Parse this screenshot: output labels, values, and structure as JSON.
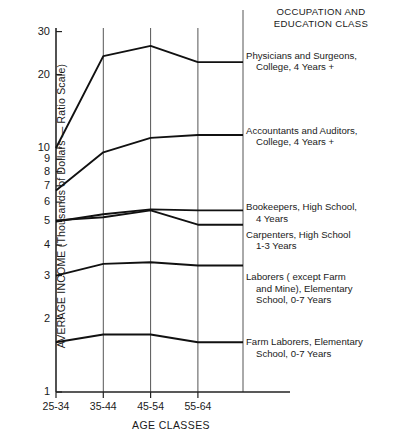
{
  "chart_data": {
    "type": "line",
    "title": "OCCUPATION AND EDUCATION CLASS",
    "xlabel": "AGE CLASSES",
    "ylabel": "AVERAGE INCOME (Thousands of Dollars — Ratio Scale)",
    "yscale": "log",
    "ylim": [
      1,
      30
    ],
    "ytick_labels": [
      "30",
      "20",
      "10",
      "9",
      "8",
      "7",
      "6",
      "5",
      "4",
      "3",
      "2",
      "1"
    ],
    "ytick_values": [
      30,
      20,
      10,
      9,
      8,
      7,
      6,
      5,
      4,
      3,
      2,
      1
    ],
    "categories": [
      "25-34",
      "35-44",
      "45-54",
      "55-64"
    ],
    "grid": "vertical-only",
    "legend_position": "right-inline-labels",
    "series": [
      {
        "name": "Physicians and Surgeons, College, 4 Years +",
        "label_line1": "Physicians and Surgeons,",
        "label_line2": "College, 4 Years +",
        "values": [
          10.0,
          23.8,
          26.2,
          22.5
        ]
      },
      {
        "name": "Accountants and Auditors, College, 4 Years +",
        "label_line1": "Accountants and Auditors,",
        "label_line2": "College, 4 Years +",
        "values": [
          6.7,
          9.6,
          11.0,
          11.3
        ]
      },
      {
        "name": "Bookeepers, High School, 4 Years",
        "label_line1": "Bookeepers, High School,",
        "label_line2": "4 Years",
        "values": [
          5.0,
          5.35,
          5.6,
          5.55
        ]
      },
      {
        "name": "Carpenters, High School 1-3 Years",
        "label_line1": "Carpenters, High School",
        "label_line2": "1-3 Years",
        "values": [
          5.05,
          5.2,
          5.55,
          4.85
        ]
      },
      {
        "name": "Laborers ( except Farm and Mine), Elementary School, 0-7 Years",
        "label_line1": "Laborers ( except Farm",
        "label_line2": "and Mine), Elementary",
        "label_line3": "School, 0-7 Years",
        "values": [
          3.0,
          3.35,
          3.4,
          3.3
        ]
      },
      {
        "name": "Farm Laborers, Elementary School, 0-7 Years",
        "label_line1": "Farm Laborers, Elementary",
        "label_line2": "School, 0-7 Years",
        "values": [
          1.6,
          1.72,
          1.72,
          1.6
        ]
      }
    ]
  },
  "axis": {
    "y_title": "AVERAGE INCOME (Thousands of Dollars — Ratio Scale)",
    "x_title": "AGE CLASSES"
  },
  "legend": {
    "title_line1": "OCCUPATION AND",
    "title_line2": "EDUCATION CLASS"
  },
  "colors": {
    "line": "#111111",
    "grid": "#555555",
    "axis": "#222222",
    "background": "#ffffff"
  }
}
